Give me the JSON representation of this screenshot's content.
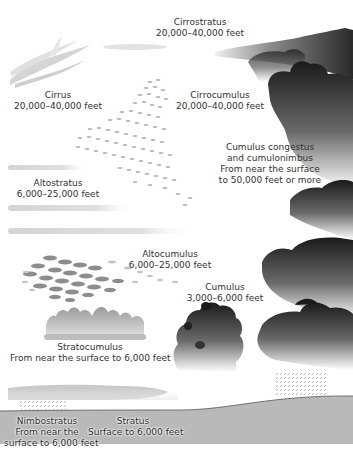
{
  "diagram": {
    "clouds": [
      {
        "id": "cirrostratus",
        "name": "Cirrostratus",
        "altitude": "20,000–40,000 feet"
      },
      {
        "id": "cirrus",
        "name": "Cirrus",
        "altitude": "20,000–40,000 feet"
      },
      {
        "id": "cirrocumulus",
        "name": "Cirrocumulus",
        "altitude": "20,000–40,000 feet"
      },
      {
        "id": "cumulonimbus",
        "name_line1": "Cumulus congestus",
        "name_line2": "and cumulonimbus",
        "altitude_line1": "From near the surface",
        "altitude_line2": "to 50,000 feet or more"
      },
      {
        "id": "altostratus",
        "name": "Altostratus",
        "altitude": "6,000–25,000 feet"
      },
      {
        "id": "altocumulus",
        "name": "Altocumulus",
        "altitude": "6,000–25,000 feet"
      },
      {
        "id": "cumulus",
        "name": "Cumulus",
        "altitude": "3,000–6,000 feet"
      },
      {
        "id": "stratocumulus",
        "name": "Stratocumulus",
        "altitude": "From near the surface to 6,000 feet"
      },
      {
        "id": "nimbostratus",
        "name": "Nimbostratus",
        "altitude_line1": "From near the",
        "altitude_line2": "surface to 6,000 feet"
      },
      {
        "id": "stratus",
        "name": "Stratus",
        "altitude": "Surface to 6,000 feet"
      }
    ],
    "colors": {
      "ground": "#b9b9b9",
      "ground_line": "#555555",
      "cloud_dark": "#1a1a1a",
      "cloud_light": "#ffffff",
      "label_text": "#333333"
    }
  }
}
